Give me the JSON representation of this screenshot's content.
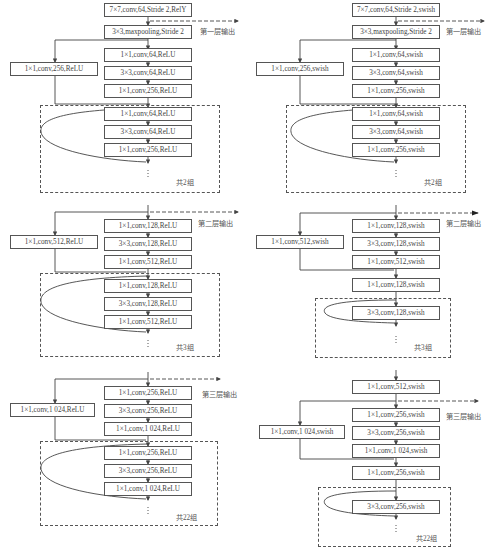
{
  "left_column": {
    "title": "ResNet-style backbone (ReLU)",
    "stem": [
      "7×7,conv,64,Stride 2,RelY",
      "3×3,maxpooling,Stride 2"
    ],
    "stage1": {
      "shortcut": "1×1,conv,256,ReLU",
      "main": [
        "1×1,conv,64,ReLU",
        "3×3,conv,64,ReLU",
        "1×1,conv,256,ReLU"
      ],
      "repeat": [
        "1×1,conv,64,ReLU",
        "3×3,conv,64,ReLU",
        "1×1,conv,256,ReLU"
      ],
      "repeat_label": "共2组",
      "output_label": "第一层输出"
    },
    "stage2": {
      "shortcut": "1×1,conv,512,ReLU",
      "main": [
        "1×1,conv,128,ReLU",
        "3×3,conv,128,ReLU",
        "1×1,conv,512,ReLU"
      ],
      "repeat": [
        "1×1,conv,128,ReLU",
        "3×3,conv,128,ReLU",
        "1×1,conv,512,ReLU"
      ],
      "repeat_label": "共3组",
      "output_label": "第二层输出"
    },
    "stage3": {
      "shortcut": "1×1,conv,1 024,ReLU",
      "main": [
        "1×1,conv,256,ReLU",
        "3×3,conv,256,ReLU",
        "1×1,conv,1 024,ReLU"
      ],
      "repeat": [
        "1×1,conv,256,ReLU",
        "3×3,conv,256,ReLU",
        "1×1,conv,1 024,ReLU"
      ],
      "repeat_label": "共22组",
      "output_label": "第三层输出"
    }
  },
  "right_column": {
    "title": "Modified backbone (swish)",
    "stem": [
      "7×7,conv,64,Stride 2,swish",
      "3×3,maxpooling,Stride 2"
    ],
    "stage1": {
      "shortcut": "1×1,conv,256,swish",
      "main": [
        "1×1,conv,64,swish",
        "3×3,conv,64,swish",
        "1×1,conv,256,swish"
      ],
      "repeat": [
        "1×1,conv,64,swish",
        "3×3,conv,64,swish",
        "1×1,conv,256,swish"
      ],
      "repeat_label": "共2组",
      "output_label": "第一层输出"
    },
    "stage2": {
      "shortcut": "1×1,conv,512,swish",
      "main": [
        "1×1,conv,128,swish",
        "3×3,conv,128,swish",
        "1×1,conv,512,swish"
      ],
      "pre": "1×1,conv,128,swish",
      "repeat": [
        "3×3,conv,128,swish"
      ],
      "repeat_label": "共3组",
      "output_label": "第二层输出"
    },
    "stage3": {
      "pre_top": "1×1,conv,512,swish",
      "shortcut": "1×1,conv,1 024,swish",
      "main": [
        "1×1,conv,256,swish",
        "3×3,conv,256,swish",
        "1×1,conv,1 024,swish"
      ],
      "pre": "1×1,conv,256,swish",
      "repeat": [
        "3×3,conv,256,swish"
      ],
      "repeat_label": "共22组",
      "output_label": "第三层输出"
    }
  },
  "ellipsis": "⋮"
}
